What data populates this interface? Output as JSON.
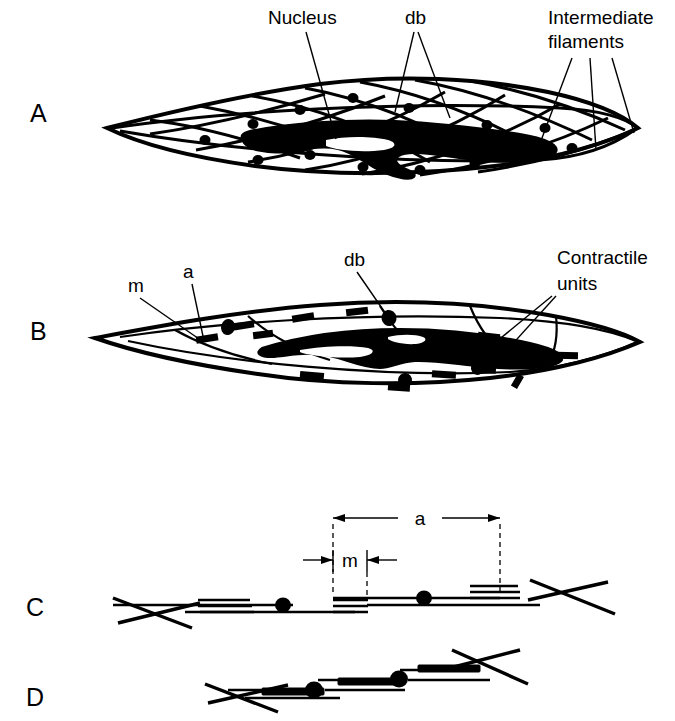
{
  "figure": {
    "background_color": "#ffffff",
    "ink_color": "#000000",
    "width": 675,
    "height": 721
  },
  "panels": [
    {
      "id": "A",
      "letter": "A",
      "letter_x": 30,
      "letter_y": 122,
      "subject": "intermediate-filament-network"
    },
    {
      "id": "B",
      "letter": "B",
      "letter_x": 30,
      "letter_y": 340,
      "subject": "contractile-units"
    },
    {
      "id": "C",
      "letter": "C",
      "letter_x": 26,
      "letter_y": 616,
      "subject": "relaxed-contractile-unit"
    },
    {
      "id": "D",
      "letter": "D",
      "letter_x": 26,
      "letter_y": 706,
      "subject": "contracted-contractile-unit"
    }
  ],
  "callouts": {
    "panel_a": [
      {
        "name": "nucleus",
        "text": "Nucleus",
        "x": 268,
        "y": 24,
        "anchor": "start"
      },
      {
        "name": "db",
        "text": "db",
        "x": 405,
        "y": 24,
        "anchor": "start"
      },
      {
        "name": "intermediate-filaments-line1",
        "text": "Intermediate",
        "x": 548,
        "y": 24,
        "anchor": "start"
      },
      {
        "name": "intermediate-filaments-line2",
        "text": "filaments",
        "x": 548,
        "y": 48,
        "anchor": "start"
      }
    ],
    "panel_b": [
      {
        "name": "m",
        "text": "m",
        "x": 128,
        "y": 292,
        "anchor": "start"
      },
      {
        "name": "a",
        "text": "a",
        "x": 183,
        "y": 278,
        "anchor": "start"
      },
      {
        "name": "db",
        "text": "db",
        "x": 344,
        "y": 266,
        "anchor": "start"
      },
      {
        "name": "contractile-units-line1",
        "text": "Contractile",
        "x": 557,
        "y": 264,
        "anchor": "start"
      },
      {
        "name": "contractile-units-line2",
        "text": "units",
        "x": 557,
        "y": 290,
        "anchor": "start"
      }
    ],
    "panel_c": [
      {
        "name": "dimension-a",
        "text": "a",
        "x": 420,
        "y": 525,
        "anchor": "middle"
      },
      {
        "name": "dimension-m",
        "text": "m",
        "x": 350,
        "y": 567,
        "anchor": "middle"
      }
    ]
  },
  "legend_terms": [
    {
      "abbr": "db",
      "meaning": "dense body"
    },
    {
      "abbr": "a",
      "meaning": "actin filament length"
    },
    {
      "abbr": "m",
      "meaning": "myosin filament length"
    }
  ],
  "dimensions": {
    "a": {
      "x_start": 333,
      "x_end": 500,
      "y": 518,
      "label": "a"
    },
    "m": {
      "x_start": 333,
      "x_end": 367,
      "y": 560,
      "label": "m"
    }
  }
}
